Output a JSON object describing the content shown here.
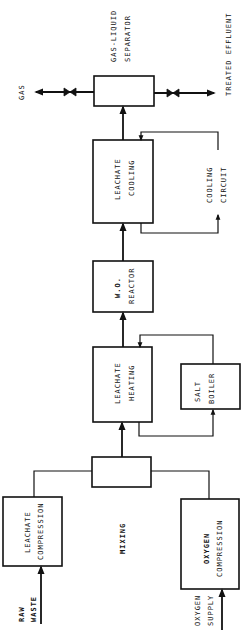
{
  "diagram": {
    "title": "",
    "orientation": "rotated-90-ccw",
    "colors": {
      "ink": "#111111",
      "background": "#ffffff"
    },
    "inputs": {
      "raw_waste": {
        "line1": "RAW",
        "line2": "WASTE"
      },
      "oxygen_supply": {
        "line1": "OXYGEN",
        "line2": "SUPPLY"
      }
    },
    "units": {
      "leachate_compression": {
        "line1": "LEACHATE",
        "line2": "COMPRESSION"
      },
      "oxygen_compression": {
        "line1": "OXYGEN",
        "line2": "COMPRESSION"
      },
      "mixing": {
        "label": "MIXING"
      },
      "leachate_heating": {
        "line1": "LEACHATE",
        "line2": "HEATING"
      },
      "salt_boiler": {
        "line1": "SALT",
        "line2": "BOILER"
      },
      "wo_reactor": {
        "line1": "W.O.",
        "line2": "REACTOR"
      },
      "leachate_cooling": {
        "line1": "LEACHATE",
        "line2": "COOLING"
      },
      "cooling_circuit": {
        "line1": "COOLING",
        "line2": "CIRCUIT"
      },
      "separator": {
        "line1": "GAS-LIQUID",
        "line2": "SEPARATOR"
      }
    },
    "outputs": {
      "gas": {
        "label": "GAS"
      },
      "treated_effluent": {
        "label": "TREATED EFFLUENT"
      }
    },
    "connections": [
      {
        "from": "RAW WASTE",
        "to": "LEACHATE COMPRESSION"
      },
      {
        "from": "OXYGEN SUPPLY",
        "to": "OXYGEN COMPRESSION"
      },
      {
        "from": "LEACHATE COMPRESSION",
        "to": "MIXING"
      },
      {
        "from": "OXYGEN COMPRESSION",
        "to": "MIXING"
      },
      {
        "from": "MIXING",
        "to": "LEACHATE HEATING"
      },
      {
        "from": "LEACHATE HEATING",
        "to": "SALT BOILER"
      },
      {
        "from": "SALT BOILER",
        "to": "LEACHATE HEATING"
      },
      {
        "from": "LEACHATE HEATING",
        "to": "W.O. REACTOR"
      },
      {
        "from": "W.O. REACTOR",
        "to": "LEACHATE COOLING"
      },
      {
        "from": "LEACHATE COOLING",
        "to": "COOLING CIRCUIT"
      },
      {
        "from": "COOLING CIRCUIT",
        "to": "LEACHATE COOLING"
      },
      {
        "from": "LEACHATE COOLING",
        "to": "GAS-LIQUID SEPARATOR"
      },
      {
        "from": "GAS-LIQUID SEPARATOR",
        "to": "GAS",
        "valve": true
      },
      {
        "from": "GAS-LIQUID SEPARATOR",
        "to": "TREATED EFFLUENT",
        "valve": true
      }
    ]
  }
}
